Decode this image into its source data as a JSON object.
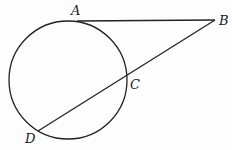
{
  "diagram": {
    "type": "geometry",
    "circle": {
      "cx": 68,
      "cy": 80,
      "r": 59
    },
    "points": {
      "A": {
        "label": "A",
        "x": 77,
        "y": 21,
        "lx": 71,
        "ly": 15
      },
      "B": {
        "label": "B",
        "x": 215,
        "y": 20,
        "lx": 219,
        "ly": 25
      },
      "C": {
        "label": "C",
        "x": 127,
        "y": 77,
        "lx": 130,
        "ly": 89
      },
      "D": {
        "label": "D",
        "x": 38,
        "y": 131,
        "lx": 25,
        "ly": 143
      }
    },
    "segments": [
      {
        "name": "tangent-AB",
        "from": "A",
        "to": "B"
      },
      {
        "name": "secant-BD",
        "from": "B",
        "to": "D"
      }
    ],
    "colors": {
      "line": "#222222",
      "label": "#1a1a1a",
      "background": "#fdfdfd"
    }
  }
}
